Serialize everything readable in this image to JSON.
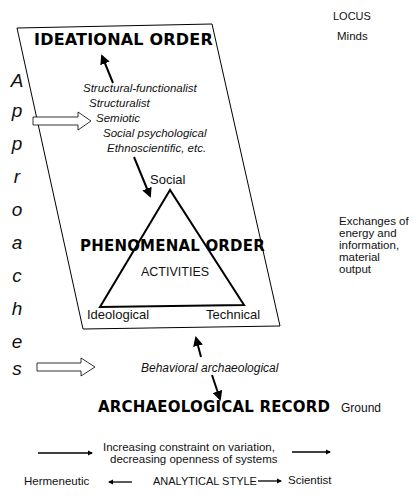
{
  "locus": {
    "header": "LOCUS",
    "minds": "Minds",
    "exchanges": [
      "Exchanges of",
      "energy and",
      "information,",
      "material",
      "output"
    ],
    "ground": "Ground"
  },
  "ideational": {
    "title": "IDEATIONAL ORDER",
    "approaches": [
      "Structural-functionalist",
      "Structuralist",
      "Semiotic",
      "Social psychological",
      "Ethnoscientific, etc."
    ]
  },
  "side_label": {
    "word": "Approaches",
    "letters": [
      "A",
      "p",
      "p",
      "r",
      "o",
      "a",
      "c",
      "h",
      "e",
      "s"
    ]
  },
  "phenomenal": {
    "title": "PHENOMENAL ORDER",
    "activities": "ACTIVITIES",
    "vertex_top": "Social",
    "vertex_left": "Ideological",
    "vertex_right": "Technical"
  },
  "behavioral": {
    "label": "Behavioral archaeological"
  },
  "record": {
    "title": "ARCHAEOLOGICAL RECORD"
  },
  "constraint": {
    "line1": "Increasing constraint on variation,",
    "line2": "decreasing openness of systems"
  },
  "analytical": {
    "left": "Hermeneutic",
    "center": "ANALYTICAL STYLE",
    "right": "Scientist"
  },
  "colors": {
    "ink": "#000000",
    "background": "#ffffff"
  }
}
